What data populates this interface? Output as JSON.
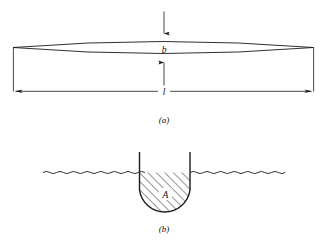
{
  "figure": {
    "panels": [
      {
        "id": "a",
        "caption": "(a)",
        "description": "Lens-shaped waterplane outline",
        "labels": {
          "beam": "b",
          "length": "l"
        }
      },
      {
        "id": "b",
        "caption": "(b)",
        "description": "Immersed hull cross-section below waterline",
        "labels": {
          "area": "A"
        }
      }
    ]
  },
  "panel_a": {
    "caption": "(a)",
    "beam_label": "b",
    "length_label": "l"
  },
  "panel_b": {
    "caption": "(b)",
    "area_label": "A"
  },
  "colors": {
    "ink": "#1a1a1a",
    "background": "#ffffff",
    "hatch": "#2b2b2b"
  }
}
